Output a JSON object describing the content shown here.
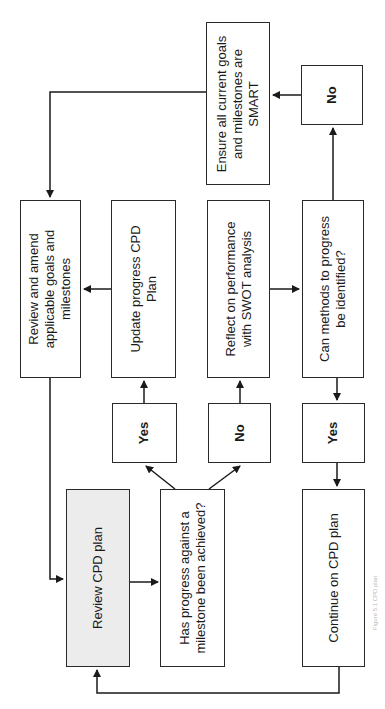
{
  "diagram": {
    "type": "flowchart",
    "orientation": "rotated-90-counterclockwise",
    "nodes": {
      "review_cpd": {
        "label": "Review CPD plan",
        "fill": "#ececec"
      },
      "has_progress": {
        "label_line1": "Has progress against a",
        "label_line2": "milestone been achieved?"
      },
      "continue_cpd": {
        "label": "Continue on CPD plan"
      },
      "yes_left": {
        "label": "Yes"
      },
      "no_mid": {
        "label": "No"
      },
      "yes_right": {
        "label": "Yes"
      },
      "review_amend": {
        "label_line1": "Review and amend",
        "label_line2": "applicable goals and",
        "label_line3": "milestones"
      },
      "update_progress": {
        "label_line1": "Update progress CPD",
        "label_line2": "Plan"
      },
      "reflect": {
        "label_line1": "Reflect on performance",
        "label_line2": "with SWOT analysis"
      },
      "can_methods": {
        "label_line1": "Can methods to progress",
        "label_line2": "be identified?"
      },
      "ensure_smart": {
        "label_line1": "Ensure all current goals",
        "label_line2": "and milestones are",
        "label_line3": "SMART"
      },
      "no_top": {
        "label": "No"
      }
    },
    "edges": [
      [
        "review_cpd",
        "has_progress"
      ],
      [
        "has_progress",
        "yes_left"
      ],
      [
        "has_progress",
        "no_mid"
      ],
      [
        "yes_left",
        "update_progress"
      ],
      [
        "no_mid",
        "reflect"
      ],
      [
        "update_progress",
        "review_amend"
      ],
      [
        "reflect",
        "can_methods"
      ],
      [
        "can_methods",
        "yes_right"
      ],
      [
        "can_methods",
        "no_top"
      ],
      [
        "yes_right",
        "continue_cpd"
      ],
      [
        "no_top",
        "ensure_smart"
      ],
      [
        "ensure_smart",
        "review_amend"
      ],
      [
        "review_amend",
        "review_cpd"
      ],
      [
        "continue_cpd",
        "review_cpd"
      ]
    ],
    "caption": "Figure 5.1 CPD plan"
  }
}
